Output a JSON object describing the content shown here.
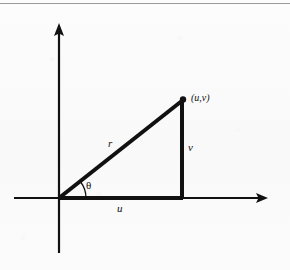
{
  "figure": {
    "background_color": "#fafafa",
    "stroke_color": "#111111",
    "rule_color": "#9a9a9a",
    "labels": {
      "hypotenuse": "r",
      "angle": "θ",
      "horizontal_leg": "u",
      "vertical_leg": "v",
      "point": "(u,v)"
    },
    "axes": {
      "origin_x": 59,
      "origin_y": 198,
      "x_axis_start_x": 14,
      "x_axis_end_x": 268,
      "y_axis_top_y": 23,
      "y_axis_bottom_y": 253,
      "arrowheads": [
        "x-axis-arrowhead",
        "y-axis-arrowhead"
      ]
    },
    "triangle": {
      "vertices": [
        [
          59,
          198
        ],
        [
          182,
          198
        ],
        [
          182,
          100
        ]
      ],
      "apex_x": 182,
      "apex_y": 100,
      "base_end_x": 182,
      "angle_arc_radius": 26
    }
  }
}
